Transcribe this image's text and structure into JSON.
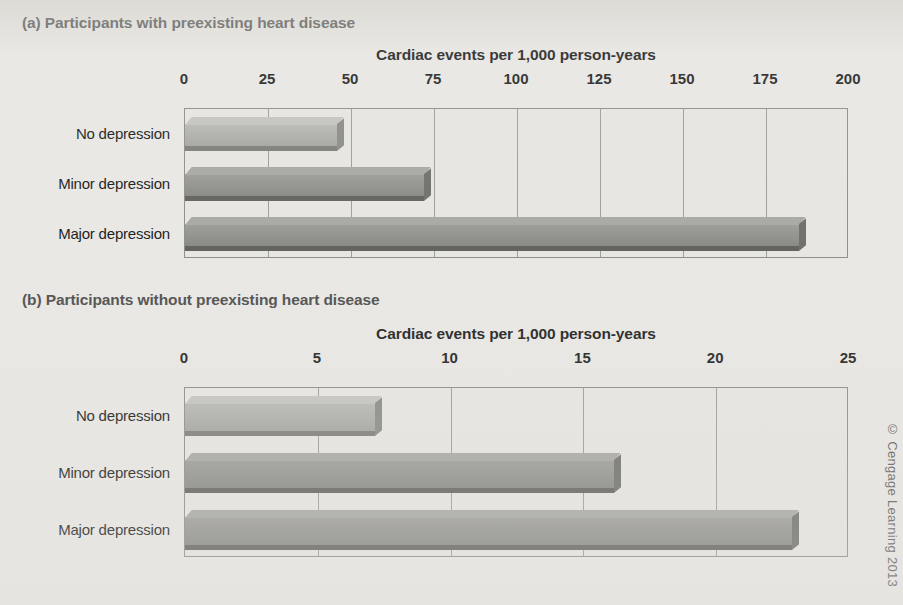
{
  "figure": {
    "copyright": "© Cengage Learning 2013",
    "axis_title": "Cardiac events per 1,000 person-years",
    "colors": {
      "light_bar": "#a9a9a5",
      "dark_bar": "#8b8b87",
      "plot_background": "#e7e6e2",
      "page_background": "#e9e8e4",
      "gridline": "#9a9a96",
      "axis_text": "#1b1b1b",
      "panel_title_text": "#4c4c4c"
    }
  },
  "chart_data": [
    {
      "type": "bar",
      "orientation": "horizontal",
      "panel": "(a)",
      "title": "(a) Participants with preexisting heart disease",
      "xlabel": "Cardiac events per 1,000 person-years",
      "ylabel": "",
      "categories": [
        "No depression",
        "Minor depression",
        "Major depression"
      ],
      "values": [
        48,
        74,
        187
      ],
      "bar_colors": [
        "#a9a9a5",
        "#8b8b87",
        "#8b8b87"
      ],
      "xlim": [
        0,
        200
      ],
      "xticks": [
        0,
        25,
        50,
        75,
        100,
        125,
        150,
        175,
        200
      ],
      "xtick_labels": [
        "0",
        "25",
        "50",
        "75",
        "100",
        "125",
        "150",
        "175",
        "200"
      ],
      "grid": true,
      "legend": false
    },
    {
      "type": "bar",
      "orientation": "horizontal",
      "panel": "(b)",
      "title": "(b) Participants without preexisting heart disease",
      "xlabel": "Cardiac events per 1,000 person-years",
      "ylabel": "",
      "categories": [
        "No depression",
        "Minor depression",
        "Major depression"
      ],
      "values": [
        7.4,
        16.4,
        23.1
      ],
      "bar_colors": [
        "#a9a9a5",
        "#8b8b87",
        "#8b8b87"
      ],
      "xlim": [
        0,
        25
      ],
      "xticks": [
        0,
        5,
        10,
        15,
        20,
        25
      ],
      "xtick_labels": [
        "0",
        "5",
        "10",
        "15",
        "20",
        "25"
      ],
      "grid": true,
      "legend": false
    }
  ]
}
